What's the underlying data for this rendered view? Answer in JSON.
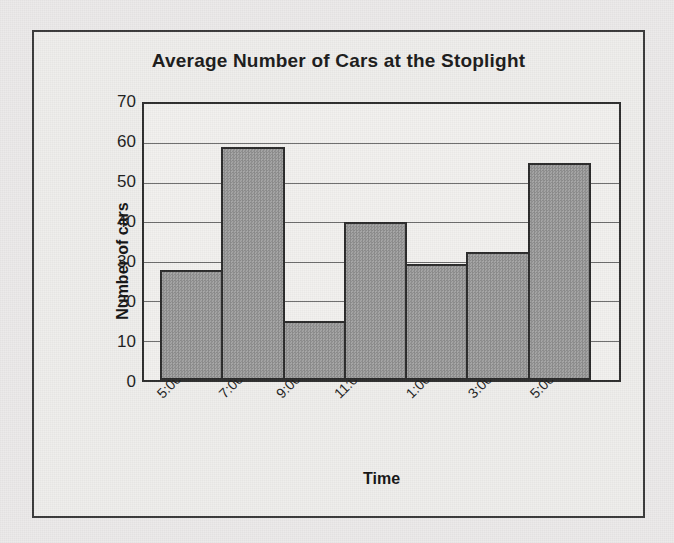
{
  "figure": {
    "background_color": "#eceaea",
    "frame_color": "#3a3a3a"
  },
  "chart_data": {
    "type": "bar",
    "title": "Average Number of Cars at the Stoplight",
    "xlabel": "Time",
    "ylabel": "Number of cars",
    "categories": [
      "5:00-6:59",
      "7:00-8:59",
      "9:00-10:59",
      "11:00-12:59",
      "1:00-2:59",
      "3:00-4:59",
      "5:00-6:59"
    ],
    "values": [
      28,
      59,
      15,
      40,
      29.5,
      32.5,
      55
    ],
    "ylim": [
      0,
      70
    ],
    "ytick_labels": [
      "70",
      "60",
      "50",
      "40",
      "30",
      "20",
      "10",
      "0"
    ],
    "ytick_values": [
      70,
      60,
      50,
      40,
      30,
      20,
      10,
      0
    ],
    "ytick_step": 10,
    "grid": true,
    "grid_axis": "y",
    "legend": false,
    "bar_fill_color": "#989898",
    "bar_border_color": "#2b2b2b",
    "plot_background_color": "#f2f1ef"
  }
}
